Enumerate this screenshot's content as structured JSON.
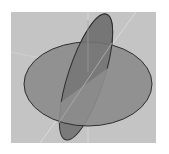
{
  "diagram": {
    "type": "3d-intersecting-planes",
    "colors": {
      "background_panel": "#c4c4c4",
      "horizontal_plane_fill": "#8c8c8c",
      "vertical_plane_fill": "#7a7a7a",
      "outline": "#2e2e2e",
      "axis_line": "#dedede"
    },
    "shapes": {
      "horizontal_ellipse": {
        "cx": 88,
        "cy": 84,
        "rx": 64,
        "ry": 42
      },
      "tilted_ellipse": {
        "cx": 86,
        "cy": 77,
        "rx": 18,
        "ry": 66,
        "rotate": 18
      }
    }
  }
}
